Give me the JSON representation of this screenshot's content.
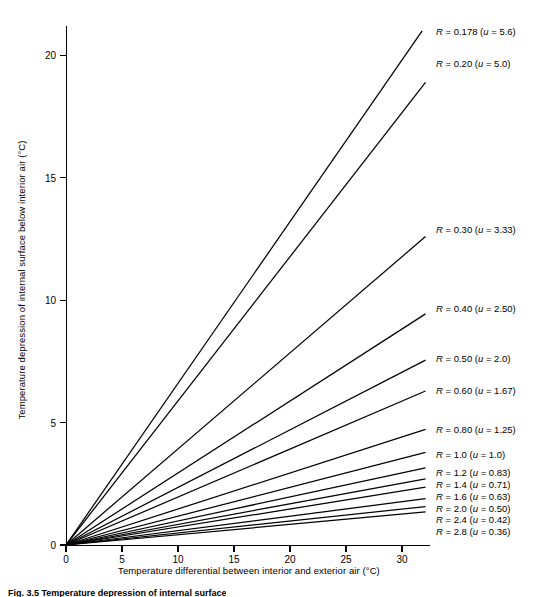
{
  "figure": {
    "caption": "Fig. 3.5 Temperature depression of internal surface"
  },
  "axes": {
    "ylabel": "Temperature depression of internal surface below interior air  (°C)",
    "xlabel": "Temperature differential between interior and exterior air  (°C)",
    "yticks": [
      "0",
      "5",
      "10",
      "15",
      "20"
    ],
    "xticks": [
      "0",
      "5",
      "10",
      "15",
      "20",
      "25",
      "30"
    ]
  },
  "chart_data": {
    "type": "line",
    "title": "",
    "xlabel": "Temperature differential between interior and exterior air (°C)",
    "ylabel": "Temperature depression of internal surface below interior air (°C)",
    "xlim": [
      0,
      32.5
    ],
    "ylim": [
      0,
      21.2
    ],
    "xticks": [
      0,
      5,
      10,
      15,
      20,
      25,
      30
    ],
    "yticks": [
      0,
      5,
      10,
      15,
      20
    ],
    "grid": false,
    "legend": "inline-right-end-of-line",
    "note": "All series are straight lines through the origin; slope is proportional to 1/R. Listed x_end / y_end are the plotted end points of each drawn line.",
    "series": [
      {
        "name": "R = 0.178 (u = 5.6)",
        "R": 0.178,
        "u": 5.6,
        "slope": 0.66,
        "x_end": 31.8,
        "y_end": 21.0
      },
      {
        "name": "R = 0.20 (u = 5.0)",
        "R": 0.2,
        "u": 5.0,
        "slope": 0.588,
        "x_end": 32.1,
        "y_end": 18.9
      },
      {
        "name": "R = 0.30 (u = 3.33)",
        "R": 0.3,
        "u": 3.33,
        "slope": 0.392,
        "x_end": 32.1,
        "y_end": 12.6
      },
      {
        "name": "R = 0.40 (u = 2.50)",
        "R": 0.4,
        "u": 2.5,
        "slope": 0.294,
        "x_end": 32.1,
        "y_end": 9.44
      },
      {
        "name": "R = 0.50 (u = 2.0)",
        "R": 0.5,
        "u": 2.0,
        "slope": 0.235,
        "x_end": 32.1,
        "y_end": 7.55
      },
      {
        "name": "R = 0.60 (u = 1.67)",
        "R": 0.6,
        "u": 1.67,
        "slope": 0.196,
        "x_end": 32.1,
        "y_end": 6.29
      },
      {
        "name": "R = 0.80 (u = 1.25)",
        "R": 0.8,
        "u": 1.25,
        "slope": 0.147,
        "x_end": 32.1,
        "y_end": 4.72
      },
      {
        "name": "R = 1.0 (u = 1.0)",
        "R": 1.0,
        "u": 1.0,
        "slope": 0.1176,
        "x_end": 32.1,
        "y_end": 3.78
      },
      {
        "name": "R = 1.2 (u = 0.83)",
        "R": 1.2,
        "u": 0.83,
        "slope": 0.098,
        "x_end": 32.1,
        "y_end": 3.15
      },
      {
        "name": "R = 1.4 (u = 0.71)",
        "R": 1.4,
        "u": 0.71,
        "slope": 0.084,
        "x_end": 32.1,
        "y_end": 2.7
      },
      {
        "name": "R = 1.6 (u = 0.63)",
        "R": 1.6,
        "u": 0.63,
        "slope": 0.0735,
        "x_end": 32.1,
        "y_end": 2.36
      },
      {
        "name": "R = 2.0 (u = 0.50)",
        "R": 2.0,
        "u": 0.5,
        "slope": 0.0588,
        "x_end": 32.1,
        "y_end": 1.89
      },
      {
        "name": "R = 2.4 (u = 0.42)",
        "R": 2.4,
        "u": 0.42,
        "slope": 0.049,
        "x_end": 32.1,
        "y_end": 1.57
      },
      {
        "name": "R = 2.8 (u = 0.36)",
        "R": 2.8,
        "u": 0.36,
        "slope": 0.042,
        "x_end": 32.1,
        "y_end": 1.35
      }
    ],
    "labels": [
      {
        "text": "R = 0.178 (u = 5.6)",
        "x_px": 436,
        "y_px": 31
      },
      {
        "text": "R = 0.20 (u = 5.0)",
        "x_px": 436,
        "y_px": 63
      },
      {
        "text": "R = 0.30 (u = 3.33)",
        "x_px": 436,
        "y_px": 229
      },
      {
        "text": "R = 0.40 (u = 2.50)",
        "x_px": 436,
        "y_px": 308
      },
      {
        "text": "R = 0.50 (u = 2.0)",
        "x_px": 436,
        "y_px": 358
      },
      {
        "text": "R = 0.60 (u = 1.67)",
        "x_px": 436,
        "y_px": 390
      },
      {
        "text": "R = 0.80 (u = 1.25)",
        "x_px": 436,
        "y_px": 429
      },
      {
        "text": "R = 1.0 (u = 1.0)",
        "x_px": 436,
        "y_px": 454
      },
      {
        "text": "R = 1.2 (u = 0.83)",
        "x_px": 436,
        "y_px": 472
      },
      {
        "text": "R = 1.4 (u = 0.71)",
        "x_px": 436,
        "y_px": 484
      },
      {
        "text": "R = 1.6 (u = 0.63)",
        "x_px": 436,
        "y_px": 496
      },
      {
        "text": "R = 2.0 (u = 0.50)",
        "x_px": 436,
        "y_px": 508
      },
      {
        "text": "R = 2.4 (u = 0.42)",
        "x_px": 436,
        "y_px": 519
      },
      {
        "text": "R = 2.8 (u = 0.36)",
        "x_px": 436,
        "y_px": 531
      }
    ]
  }
}
